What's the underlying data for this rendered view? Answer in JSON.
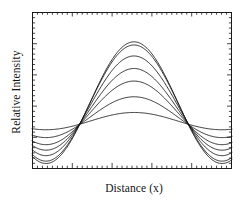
{
  "figure": {
    "name": "interference-fringe-visibility-plot",
    "background": "#ffffff",
    "line_color": "#121212",
    "axis_color": "#1a1a1a"
  },
  "axes": {
    "xlabel": "Distance (x)",
    "ylabel": "Relative Intensity",
    "frame": {
      "left": 32,
      "top": 12,
      "right": 232,
      "bottom": 169
    },
    "x_tick_count_minor": 40,
    "y_tick_count_minor": 30,
    "ticks_direction": "inward",
    "tick_labels_shown": false,
    "grid": false,
    "legend": false
  },
  "chart_data": {
    "type": "line",
    "title": "",
    "xlabel": "Distance (x)",
    "ylabel": "Relative Intensity",
    "xlim": [
      0,
      1
    ],
    "ylim": [
      0,
      1
    ],
    "x_tick_labels": [],
    "y_tick_labels": [],
    "grid": false,
    "legend_position": "none",
    "node_positions_x": [
      0.29,
      0.73
    ],
    "peak_position_x": 0.51,
    "series": [
      {
        "name": "visibility-1.00",
        "visibility": 1.0,
        "peak_y": 0.81,
        "edge_y": 0.035
      },
      {
        "name": "visibility-0.96",
        "visibility": 0.96,
        "peak_y": 0.79,
        "edge_y": 0.05
      },
      {
        "name": "visibility-0.80",
        "visibility": 0.8,
        "peak_y": 0.72,
        "edge_y": 0.085
      },
      {
        "name": "visibility-0.64",
        "visibility": 0.64,
        "peak_y": 0.64,
        "edge_y": 0.12
      },
      {
        "name": "visibility-0.48",
        "visibility": 0.48,
        "peak_y": 0.56,
        "edge_y": 0.155
      },
      {
        "name": "visibility-0.32",
        "visibility": 0.32,
        "peak_y": 0.46,
        "edge_y": 0.2
      },
      {
        "name": "visibility-0.16",
        "visibility": 0.16,
        "peak_y": 0.36,
        "edge_y": 0.25
      }
    ],
    "x": [
      0.0,
      0.02,
      0.04,
      0.06,
      0.08,
      0.1,
      0.12,
      0.14,
      0.16,
      0.18,
      0.2,
      0.22,
      0.24,
      0.26,
      0.28,
      0.3,
      0.32,
      0.34,
      0.36,
      0.38,
      0.4,
      0.42,
      0.44,
      0.46,
      0.48,
      0.5,
      0.52,
      0.54,
      0.56,
      0.58,
      0.6,
      0.62,
      0.64,
      0.66,
      0.68,
      0.7,
      0.72,
      0.74,
      0.76,
      0.78,
      0.8,
      0.82,
      0.84,
      0.86,
      0.88,
      0.9,
      0.92,
      0.94,
      0.96,
      0.98,
      1.0
    ]
  }
}
